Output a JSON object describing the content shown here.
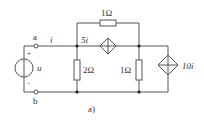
{
  "figure": {
    "caption": "a)",
    "terminals": {
      "a": "a",
      "b": "b"
    },
    "source": {
      "label": "u",
      "plus": "+",
      "minus": "−"
    },
    "current_label": "i",
    "resistors": {
      "top": "1Ω",
      "left_shunt": "2Ω",
      "right_shunt": "1Ω"
    },
    "dependent_sources": {
      "series": "5i",
      "shunt": "10i"
    }
  }
}
